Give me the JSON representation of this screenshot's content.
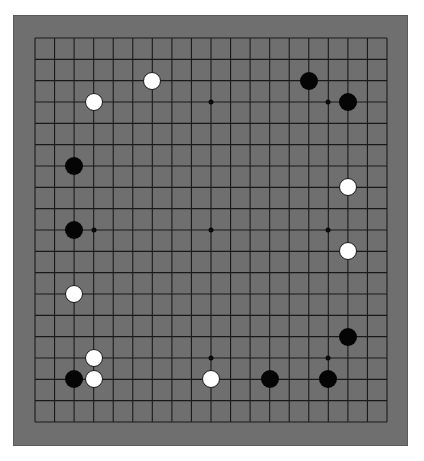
{
  "board": {
    "size": 19,
    "colors": {
      "board": "#6f6f6f",
      "line": "#1a1a1a",
      "black": "#050505",
      "white": "#ffffff"
    },
    "grid": {
      "x0": 35,
      "y0": 38,
      "x1": 387,
      "y1": 422
    },
    "star_points": [
      [
        3,
        3
      ],
      [
        9,
        3
      ],
      [
        15,
        3
      ],
      [
        3,
        9
      ],
      [
        9,
        9
      ],
      [
        15,
        9
      ],
      [
        3,
        15
      ],
      [
        9,
        15
      ],
      [
        15,
        15
      ]
    ],
    "stones": [
      {
        "color": "black",
        "col": 14,
        "row": 2
      },
      {
        "color": "black",
        "col": 16,
        "row": 3
      },
      {
        "color": "black",
        "col": 2,
        "row": 6
      },
      {
        "color": "black",
        "col": 2,
        "row": 9
      },
      {
        "color": "black",
        "col": 16,
        "row": 14
      },
      {
        "color": "black",
        "col": 2,
        "row": 16
      },
      {
        "color": "black",
        "col": 12,
        "row": 16
      },
      {
        "color": "black",
        "col": 15,
        "row": 16
      },
      {
        "color": "white",
        "col": 6,
        "row": 2
      },
      {
        "color": "white",
        "col": 3,
        "row": 3
      },
      {
        "color": "white",
        "col": 16,
        "row": 7
      },
      {
        "color": "white",
        "col": 16,
        "row": 10
      },
      {
        "color": "white",
        "col": 2,
        "row": 12
      },
      {
        "color": "white",
        "col": 3,
        "row": 15
      },
      {
        "color": "white",
        "col": 3,
        "row": 16
      },
      {
        "color": "white",
        "col": 9,
        "row": 16
      }
    ]
  }
}
